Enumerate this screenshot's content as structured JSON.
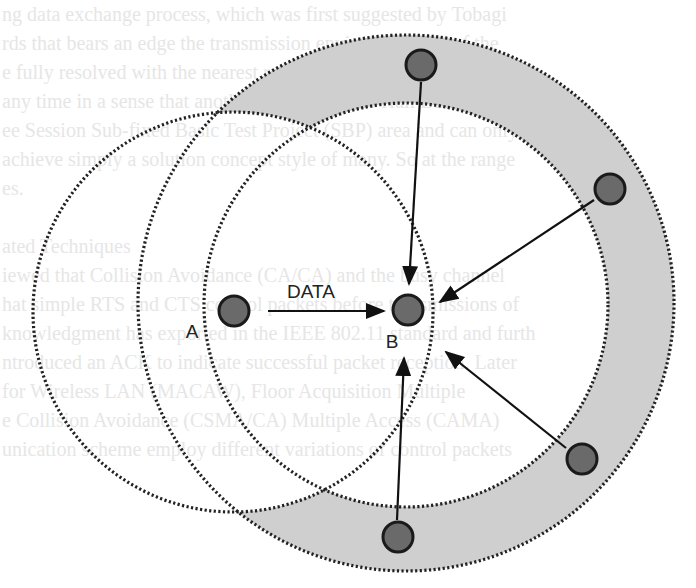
{
  "diagram": {
    "labels": {
      "data": "DATA",
      "node_a": "A",
      "node_b": "B"
    },
    "colors": {
      "ring_fill": "#cfcfcf",
      "node_fill": "#6a6a6a",
      "node_stroke": "#1a1a1a",
      "circle_stroke": "#222222",
      "arrow": "#111111"
    },
    "circles": [
      {
        "name": "range-a",
        "cx": 233,
        "cy": 312,
        "r": 200
      },
      {
        "name": "range-b-inner",
        "cx": 406,
        "cy": 305,
        "r": 202
      },
      {
        "name": "range-b-outer",
        "cx": 406,
        "cy": 303,
        "r": 268
      }
    ],
    "nodes": [
      {
        "name": "node-a",
        "cx": 234,
        "cy": 311
      },
      {
        "name": "node-b",
        "cx": 408,
        "cy": 310
      },
      {
        "name": "node-top",
        "cx": 421,
        "cy": 65
      },
      {
        "name": "node-right",
        "cx": 610,
        "cy": 189
      },
      {
        "name": "node-lower-right",
        "cx": 582,
        "cy": 459
      },
      {
        "name": "node-bottom",
        "cx": 398,
        "cy": 537
      }
    ],
    "arrows": [
      {
        "name": "arrow-a-to-b",
        "from": [
          268,
          311
        ],
        "to": [
          384,
          311
        ]
      },
      {
        "name": "arrow-top-to-b",
        "from": [
          421,
          82
        ],
        "to": [
          409,
          284
        ]
      },
      {
        "name": "arrow-right-to-b",
        "from": [
          594,
          200
        ],
        "to": [
          440,
          302
        ]
      },
      {
        "name": "arrow-lower-right-to-b",
        "from": [
          566,
          448
        ],
        "to": [
          446,
          352
        ]
      },
      {
        "name": "arrow-bottom-to-b",
        "from": [
          397,
          520
        ],
        "to": [
          404,
          358
        ]
      }
    ]
  },
  "background_text": [
    "ng data exchange process, which was first suggested by Tobagi",
    "rds that bears an edge the transmission environment out of the",
    "e fully resolved with the nearest region, though, in a certain",
    "any time in a sense that another was access the Hall Band",
    "ee Session Sub-fixed Basic Test Project (SBP) area and can only",
    "achieve simply a solution concept style of many. So at the range",
    "es.",
    "",
    "ated Techniques",
    "iewed that Collision Avoidance (CA/CA) and the busy channel",
    "hat simple RTS and CTS control packets before transmissions of",
    "knowledgment has exported in the IEEE 802.11 standard and furth",
    "ntroduced an ACK to indicate successful packet reception. Later",
    "for Wireless LAN (MACAW), Floor Acquisition Multiple",
    "e Collision Avoidance (CSMA/CA) Multiple Access (CAMA)",
    "unication scheme employ different variations of control packets"
  ]
}
